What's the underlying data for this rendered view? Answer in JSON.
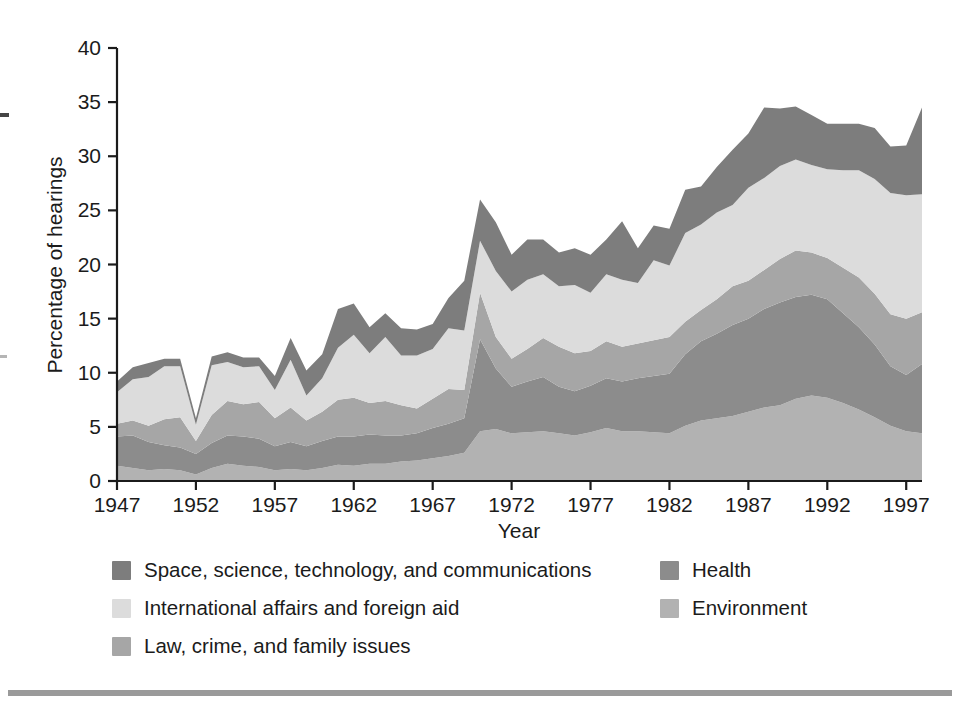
{
  "chart_data": {
    "type": "area",
    "stacked": true,
    "title": "",
    "subtitle": "",
    "xlabel": "Year",
    "ylabel": "Percentage of hearings",
    "xlim": [
      1947,
      1998
    ],
    "ylim": [
      0,
      40
    ],
    "ytick_step": 5,
    "yticks": [
      0,
      5,
      10,
      15,
      20,
      25,
      30,
      35,
      40
    ],
    "xticks": [
      1947,
      1952,
      1957,
      1962,
      1967,
      1972,
      1977,
      1982,
      1987,
      1992,
      1997
    ],
    "xtick_labels": [
      "1947",
      "1952",
      "1957",
      "1962",
      "1967",
      "1972",
      "1977",
      "1982",
      "1987",
      "1992",
      "1997"
    ],
    "ytick_labels": [
      "0",
      "5",
      "10",
      "15",
      "20",
      "25",
      "30",
      "35",
      "40"
    ],
    "grid": false,
    "legend_position": "below",
    "x": [
      1947,
      1948,
      1949,
      1950,
      1951,
      1952,
      1953,
      1954,
      1955,
      1956,
      1957,
      1958,
      1959,
      1960,
      1961,
      1962,
      1963,
      1964,
      1965,
      1966,
      1967,
      1968,
      1969,
      1970,
      1971,
      1972,
      1973,
      1974,
      1975,
      1976,
      1977,
      1978,
      1979,
      1980,
      1981,
      1982,
      1983,
      1984,
      1985,
      1986,
      1987,
      1988,
      1989,
      1990,
      1991,
      1992,
      1993,
      1994,
      1995,
      1996,
      1997,
      1998
    ],
    "stack_order_bottom_to_top": [
      "Environment",
      "Health",
      "Law, crime, and family issues",
      "International affairs and foreign aid",
      "Space, science, technology, and communications"
    ],
    "series": [
      {
        "name": "Environment",
        "color": "#b2b2b2",
        "values": [
          1.4,
          1.2,
          1.0,
          1.1,
          1.0,
          0.6,
          1.2,
          1.6,
          1.4,
          1.3,
          1.0,
          1.1,
          1.0,
          1.2,
          1.5,
          1.4,
          1.6,
          1.6,
          1.8,
          1.9,
          2.1,
          2.3,
          2.6,
          4.6,
          4.8,
          4.4,
          4.5,
          4.6,
          4.4,
          4.2,
          4.5,
          4.9,
          4.6,
          4.6,
          4.5,
          4.4,
          5.1,
          5.6,
          5.8,
          6.0,
          6.4,
          6.8,
          7.0,
          7.6,
          7.9,
          7.7,
          7.2,
          6.6,
          5.9,
          5.1,
          4.6,
          4.4
        ]
      },
      {
        "name": "Health",
        "color": "#8c8c8c",
        "values": [
          2.7,
          3.0,
          2.6,
          2.2,
          2.1,
          1.9,
          2.3,
          2.6,
          2.7,
          2.6,
          2.2,
          2.5,
          2.2,
          2.5,
          2.6,
          2.7,
          2.7,
          2.6,
          2.4,
          2.5,
          2.8,
          3.0,
          3.2,
          8.5,
          5.6,
          4.3,
          4.7,
          5.0,
          4.3,
          4.1,
          4.3,
          4.6,
          4.6,
          4.9,
          5.2,
          5.5,
          6.6,
          7.3,
          7.8,
          8.4,
          8.6,
          9.1,
          9.5,
          9.4,
          9.3,
          9.1,
          8.3,
          7.6,
          6.7,
          5.5,
          5.2,
          6.4
        ]
      },
      {
        "name": "Law, crime, and family issues",
        "color": "#a6a6a6",
        "values": [
          1.2,
          1.4,
          1.5,
          2.4,
          2.8,
          1.2,
          2.6,
          3.2,
          3.0,
          3.4,
          2.6,
          3.2,
          2.4,
          2.7,
          3.4,
          3.6,
          2.9,
          3.2,
          2.8,
          2.3,
          2.7,
          3.2,
          2.6,
          4.3,
          2.9,
          2.6,
          3.0,
          3.6,
          3.7,
          3.5,
          3.2,
          3.4,
          3.2,
          3.2,
          3.3,
          3.4,
          3.0,
          2.9,
          3.2,
          3.6,
          3.5,
          3.6,
          4.0,
          4.3,
          3.9,
          3.8,
          4.2,
          4.6,
          4.7,
          4.8,
          5.2,
          4.8
        ]
      },
      {
        "name": "International affairs and foreign aid",
        "color": "#dcdcdc",
        "values": [
          2.9,
          3.8,
          4.5,
          4.9,
          4.7,
          1.5,
          4.6,
          3.6,
          3.4,
          3.3,
          2.6,
          4.4,
          2.3,
          3.1,
          4.8,
          5.8,
          4.6,
          5.9,
          4.6,
          4.9,
          4.6,
          5.6,
          5.5,
          4.8,
          6.1,
          6.2,
          6.4,
          5.9,
          5.6,
          6.3,
          5.4,
          6.2,
          6.2,
          5.6,
          7.4,
          6.6,
          8.2,
          7.9,
          8.0,
          7.5,
          8.6,
          8.5,
          8.6,
          8.4,
          8.1,
          8.2,
          9.0,
          9.9,
          10.6,
          11.2,
          11.4,
          10.9
        ]
      },
      {
        "name": "Space, science, technology, and communications",
        "color": "#7d7d7d",
        "values": [
          1.0,
          1.1,
          1.3,
          0.7,
          0.7,
          0.6,
          0.8,
          0.9,
          0.9,
          0.8,
          1.3,
          2.0,
          2.3,
          2.2,
          3.6,
          2.9,
          2.4,
          2.2,
          2.5,
          2.4,
          2.3,
          2.8,
          4.6,
          3.8,
          4.5,
          3.4,
          3.7,
          3.2,
          3.1,
          3.4,
          3.5,
          3.2,
          5.4,
          3.2,
          3.2,
          3.4,
          4.0,
          3.5,
          4.2,
          5.1,
          5.0,
          6.5,
          5.3,
          4.9,
          4.6,
          4.2,
          4.3,
          4.3,
          4.7,
          4.3,
          4.6,
          8.0
        ]
      }
    ]
  },
  "axes": {
    "y_axis_title": "Percentage of hearings",
    "x_axis_title": "Year"
  },
  "legend": {
    "left_column": [
      {
        "label": "Space, science, technology, and communications",
        "color": "#7d7d7d"
      },
      {
        "label": "International affairs and foreign aid",
        "color": "#dcdcdc"
      },
      {
        "label": "Law, crime, and family issues",
        "color": "#a6a6a6"
      }
    ],
    "right_column": [
      {
        "label": "Health",
        "color": "#8c8c8c"
      },
      {
        "label": "Environment",
        "color": "#b2b2b2"
      }
    ]
  }
}
